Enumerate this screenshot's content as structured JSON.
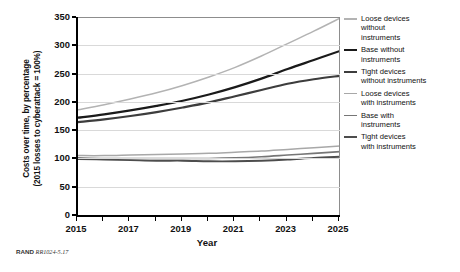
{
  "chart_data": {
    "type": "line",
    "title": "",
    "xlabel": "Year",
    "ylabel": "Costs over time, by percentage (2015 losses to cyberattack = 100%)",
    "ylabel_line1": "Costs over time, by percentage",
    "ylabel_line2": "(2015 losses to cyberattack = 100%)",
    "xlim": [
      2015,
      2025
    ],
    "ylim": [
      0,
      350
    ],
    "x_tick_labels": [
      "2015",
      "2017",
      "2019",
      "2021",
      "2023",
      "2025"
    ],
    "x_tick_values": [
      2015,
      2017,
      2019,
      2021,
      2023,
      2025
    ],
    "x_minor_ticks": [
      2015,
      2016,
      2017,
      2018,
      2019,
      2020,
      2021,
      2022,
      2023,
      2024,
      2025
    ],
    "y_tick_labels": [
      "0",
      "50",
      "100",
      "150",
      "200",
      "250",
      "300",
      "350"
    ],
    "y_tick_values": [
      0,
      50,
      100,
      150,
      200,
      250,
      300,
      350
    ],
    "grid": "horizontal",
    "legend_position": "right",
    "x": [
      2015,
      2016,
      2017,
      2018,
      2019,
      2020,
      2021,
      2022,
      2023,
      2024,
      2025
    ],
    "series": [
      {
        "name": "Loose devices without instruments",
        "label": "Loose devices\nwithout\ninstruments",
        "color": "#b3b3b3",
        "width": 1.5,
        "values": [
          186,
          195,
          205,
          216,
          229,
          244,
          261,
          281,
          303,
          325,
          348
        ]
      },
      {
        "name": "Base without instruments",
        "label": "Base without\ninstruments",
        "color": "#1a1a1a",
        "width": 2.2,
        "values": [
          172,
          178,
          185,
          193,
          202,
          213,
          226,
          241,
          258,
          274,
          290
        ]
      },
      {
        "name": "Tight devices without instruments",
        "label": "Tight devices\nwithout instruments",
        "color": "#3d3d3d",
        "width": 2.2,
        "values": [
          164,
          169,
          175,
          182,
          190,
          199,
          210,
          221,
          232,
          240,
          246
        ]
      },
      {
        "name": "Loose devices with instruments",
        "label": "Loose devices\nwith instruments",
        "color": "#a8a8a8",
        "width": 1.5,
        "values": [
          105,
          105,
          106,
          107,
          108,
          109,
          111,
          113,
          116,
          119,
          122
        ]
      },
      {
        "name": "Base with instruments",
        "label": "Base with\ninstruments",
        "color": "#767676",
        "width": 1.6,
        "values": [
          101,
          100,
          100,
          100,
          100,
          100,
          101,
          103,
          106,
          109,
          112
        ]
      },
      {
        "name": "Tight devices with instruments",
        "label": "Tight devices\nwith instruments",
        "color": "#4d4d4d",
        "width": 1.9,
        "values": [
          99,
          98,
          97,
          96,
          96,
          95,
          95,
          96,
          98,
          101,
          103
        ]
      }
    ]
  },
  "footer": {
    "rand": "RAND",
    "number": "RR1024-5.17"
  }
}
